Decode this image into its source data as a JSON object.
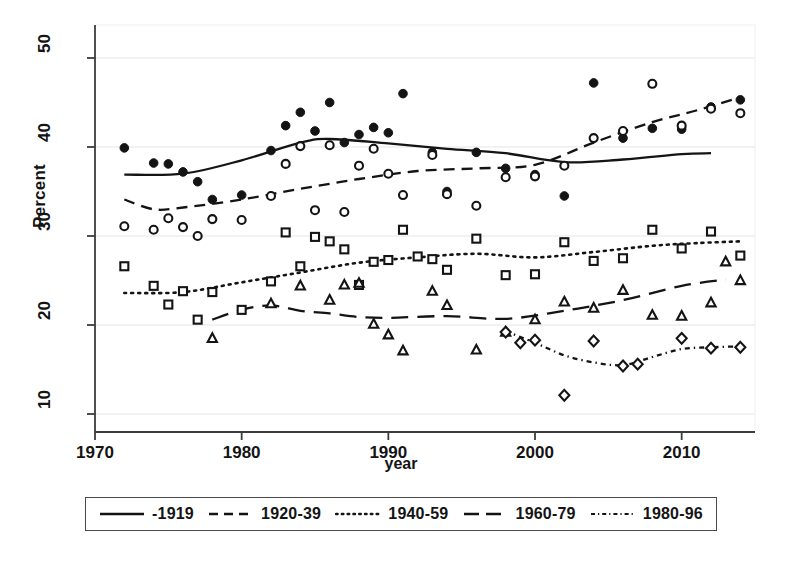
{
  "chart_data": {
    "type": "scatter",
    "title": "",
    "xlabel": "year",
    "ylabel": "Percent",
    "xlim": [
      1970,
      2015
    ],
    "ylim": [
      8,
      52
    ],
    "xticks": [
      1970,
      1980,
      1990,
      2000,
      2010
    ],
    "yticks": [
      10,
      20,
      30,
      40,
      50
    ],
    "grid": "horizontal-faint",
    "legend_position": "below-plot",
    "series": [
      {
        "name": "-1919",
        "marker": "filled-circle",
        "line": "solid",
        "points": [
          {
            "x": 1972,
            "y": 39.9
          },
          {
            "x": 1974,
            "y": 38.2
          },
          {
            "x": 1975,
            "y": 38.1
          },
          {
            "x": 1976,
            "y": 37.2
          },
          {
            "x": 1977,
            "y": 36.1
          },
          {
            "x": 1978,
            "y": 34.1
          },
          {
            "x": 1980,
            "y": 34.6
          },
          {
            "x": 1982,
            "y": 39.6
          },
          {
            "x": 1983,
            "y": 42.4
          },
          {
            "x": 1984,
            "y": 43.9
          },
          {
            "x": 1985,
            "y": 41.8
          },
          {
            "x": 1986,
            "y": 45.0
          },
          {
            "x": 1987,
            "y": 40.5
          },
          {
            "x": 1988,
            "y": 41.4
          },
          {
            "x": 1989,
            "y": 42.2
          },
          {
            "x": 1990,
            "y": 41.6
          },
          {
            "x": 1991,
            "y": 46.0
          },
          {
            "x": 1993,
            "y": 39.4
          },
          {
            "x": 1994,
            "y": 35.0
          },
          {
            "x": 1996,
            "y": 39.4
          },
          {
            "x": 1998,
            "y": 37.6
          },
          {
            "x": 2000,
            "y": 36.9
          },
          {
            "x": 2002,
            "y": 34.5
          },
          {
            "x": 2004,
            "y": 47.2
          },
          {
            "x": 2006,
            "y": 41.0
          },
          {
            "x": 2008,
            "y": 42.1
          },
          {
            "x": 2010,
            "y": 42.0
          },
          {
            "x": 2012,
            "y": 44.5
          },
          {
            "x": 2014,
            "y": 45.3
          }
        ],
        "smooth": [
          {
            "x": 1972,
            "y": 36.9
          },
          {
            "x": 1976,
            "y": 37.0
          },
          {
            "x": 1980,
            "y": 38.5
          },
          {
            "x": 1984,
            "y": 40.5
          },
          {
            "x": 1986,
            "y": 40.9
          },
          {
            "x": 1990,
            "y": 40.4
          },
          {
            "x": 1994,
            "y": 39.8
          },
          {
            "x": 1998,
            "y": 39.3
          },
          {
            "x": 2002,
            "y": 38.3
          },
          {
            "x": 2006,
            "y": 38.6
          },
          {
            "x": 2010,
            "y": 39.2
          },
          {
            "x": 2012,
            "y": 39.3
          }
        ]
      },
      {
        "name": "1920-39",
        "marker": "open-circle",
        "line": "dashed",
        "points": [
          {
            "x": 1972,
            "y": 31.1
          },
          {
            "x": 1974,
            "y": 30.7
          },
          {
            "x": 1975,
            "y": 32.0
          },
          {
            "x": 1976,
            "y": 31.0
          },
          {
            "x": 1977,
            "y": 30.0
          },
          {
            "x": 1978,
            "y": 31.9
          },
          {
            "x": 1980,
            "y": 31.8
          },
          {
            "x": 1982,
            "y": 34.5
          },
          {
            "x": 1983,
            "y": 38.1
          },
          {
            "x": 1984,
            "y": 40.1
          },
          {
            "x": 1985,
            "y": 32.9
          },
          {
            "x": 1986,
            "y": 40.2
          },
          {
            "x": 1987,
            "y": 32.7
          },
          {
            "x": 1988,
            "y": 37.9
          },
          {
            "x": 1989,
            "y": 39.8
          },
          {
            "x": 1990,
            "y": 37.0
          },
          {
            "x": 1991,
            "y": 34.6
          },
          {
            "x": 1993,
            "y": 39.1
          },
          {
            "x": 1994,
            "y": 34.7
          },
          {
            "x": 1996,
            "y": 33.4
          },
          {
            "x": 1998,
            "y": 36.6
          },
          {
            "x": 2000,
            "y": 36.7
          },
          {
            "x": 2002,
            "y": 37.9
          },
          {
            "x": 2004,
            "y": 41.0
          },
          {
            "x": 2006,
            "y": 41.8
          },
          {
            "x": 2008,
            "y": 47.1
          },
          {
            "x": 2010,
            "y": 42.4
          },
          {
            "x": 2012,
            "y": 44.3
          },
          {
            "x": 2014,
            "y": 43.8
          }
        ],
        "smooth": [
          {
            "x": 1972,
            "y": 34.1
          },
          {
            "x": 1974,
            "y": 33.0
          },
          {
            "x": 1976,
            "y": 33.2
          },
          {
            "x": 1980,
            "y": 34.1
          },
          {
            "x": 1984,
            "y": 35.3
          },
          {
            "x": 1988,
            "y": 36.4
          },
          {
            "x": 1992,
            "y": 37.3
          },
          {
            "x": 1996,
            "y": 37.6
          },
          {
            "x": 2000,
            "y": 38.0
          },
          {
            "x": 2004,
            "y": 40.5
          },
          {
            "x": 2008,
            "y": 42.8
          },
          {
            "x": 2011,
            "y": 44.1
          },
          {
            "x": 2014,
            "y": 45.6
          }
        ]
      },
      {
        "name": "1940-59",
        "marker": "open-square",
        "line": "dotted",
        "points": [
          {
            "x": 1972,
            "y": 26.6
          },
          {
            "x": 1974,
            "y": 24.4
          },
          {
            "x": 1975,
            "y": 22.3
          },
          {
            "x": 1976,
            "y": 23.8
          },
          {
            "x": 1977,
            "y": 20.6
          },
          {
            "x": 1978,
            "y": 23.7
          },
          {
            "x": 1980,
            "y": 21.7
          },
          {
            "x": 1982,
            "y": 24.9
          },
          {
            "x": 1983,
            "y": 30.4
          },
          {
            "x": 1984,
            "y": 26.6
          },
          {
            "x": 1985,
            "y": 29.9
          },
          {
            "x": 1986,
            "y": 29.4
          },
          {
            "x": 1987,
            "y": 28.5
          },
          {
            "x": 1988,
            "y": 24.5
          },
          {
            "x": 1989,
            "y": 27.1
          },
          {
            "x": 1990,
            "y": 27.3
          },
          {
            "x": 1991,
            "y": 30.7
          },
          {
            "x": 1992,
            "y": 27.7
          },
          {
            "x": 1993,
            "y": 27.4
          },
          {
            "x": 1994,
            "y": 26.2
          },
          {
            "x": 1996,
            "y": 29.7
          },
          {
            "x": 1998,
            "y": 25.6
          },
          {
            "x": 2000,
            "y": 25.7
          },
          {
            "x": 2002,
            "y": 29.3
          },
          {
            "x": 2004,
            "y": 27.2
          },
          {
            "x": 2006,
            "y": 27.5
          },
          {
            "x": 2008,
            "y": 30.7
          },
          {
            "x": 2010,
            "y": 28.6
          },
          {
            "x": 2012,
            "y": 30.5
          },
          {
            "x": 2014,
            "y": 27.8
          }
        ],
        "smooth": [
          {
            "x": 1972,
            "y": 23.6
          },
          {
            "x": 1976,
            "y": 23.7
          },
          {
            "x": 1980,
            "y": 24.8
          },
          {
            "x": 1984,
            "y": 25.9
          },
          {
            "x": 1988,
            "y": 27.0
          },
          {
            "x": 1992,
            "y": 27.6
          },
          {
            "x": 1996,
            "y": 28.0
          },
          {
            "x": 2000,
            "y": 27.6
          },
          {
            "x": 2004,
            "y": 28.2
          },
          {
            "x": 2008,
            "y": 28.9
          },
          {
            "x": 2011,
            "y": 29.2
          },
          {
            "x": 2014,
            "y": 29.4
          }
        ]
      },
      {
        "name": "1960-79",
        "marker": "open-triangle",
        "line": "long-dash",
        "points": [
          {
            "x": 1978,
            "y": 18.5
          },
          {
            "x": 1982,
            "y": 22.4
          },
          {
            "x": 1984,
            "y": 24.4
          },
          {
            "x": 1986,
            "y": 22.8
          },
          {
            "x": 1987,
            "y": 24.5
          },
          {
            "x": 1988,
            "y": 24.7
          },
          {
            "x": 1989,
            "y": 20.1
          },
          {
            "x": 1990,
            "y": 18.9
          },
          {
            "x": 1991,
            "y": 17.1
          },
          {
            "x": 1993,
            "y": 23.8
          },
          {
            "x": 1994,
            "y": 22.2
          },
          {
            "x": 1996,
            "y": 17.2
          },
          {
            "x": 1998,
            "y": 19.2
          },
          {
            "x": 2000,
            "y": 20.6
          },
          {
            "x": 2002,
            "y": 22.6
          },
          {
            "x": 2004,
            "y": 21.9
          },
          {
            "x": 2006,
            "y": 23.9
          },
          {
            "x": 2008,
            "y": 21.1
          },
          {
            "x": 2010,
            "y": 21.0
          },
          {
            "x": 2012,
            "y": 22.5
          },
          {
            "x": 2013,
            "y": 27.1
          },
          {
            "x": 2014,
            "y": 25.0
          }
        ],
        "smooth": [
          {
            "x": 1978,
            "y": 20.6
          },
          {
            "x": 1980,
            "y": 21.7
          },
          {
            "x": 1982,
            "y": 22.2
          },
          {
            "x": 1984,
            "y": 21.6
          },
          {
            "x": 1986,
            "y": 21.3
          },
          {
            "x": 1988,
            "y": 20.9
          },
          {
            "x": 1990,
            "y": 20.8
          },
          {
            "x": 1994,
            "y": 21.0
          },
          {
            "x": 1998,
            "y": 20.7
          },
          {
            "x": 2002,
            "y": 21.6
          },
          {
            "x": 2006,
            "y": 22.8
          },
          {
            "x": 2010,
            "y": 24.4
          },
          {
            "x": 2013,
            "y": 25.1
          }
        ]
      },
      {
        "name": "1980-96",
        "marker": "open-diamond",
        "line": "dash-dot",
        "points": [
          {
            "x": 1998,
            "y": 19.2
          },
          {
            "x": 1999,
            "y": 18.0
          },
          {
            "x": 2000,
            "y": 18.3
          },
          {
            "x": 2002,
            "y": 12.1
          },
          {
            "x": 2004,
            "y": 18.2
          },
          {
            "x": 2006,
            "y": 15.4
          },
          {
            "x": 2007,
            "y": 15.6
          },
          {
            "x": 2010,
            "y": 18.5
          },
          {
            "x": 2012,
            "y": 17.4
          },
          {
            "x": 2014,
            "y": 17.5
          }
        ],
        "smooth": [
          {
            "x": 1998,
            "y": 19.3
          },
          {
            "x": 2000,
            "y": 18.0
          },
          {
            "x": 2002,
            "y": 16.6
          },
          {
            "x": 2004,
            "y": 15.8
          },
          {
            "x": 2006,
            "y": 15.5
          },
          {
            "x": 2008,
            "y": 16.4
          },
          {
            "x": 2010,
            "y": 17.3
          },
          {
            "x": 2012,
            "y": 17.5
          },
          {
            "x": 2014,
            "y": 17.6
          }
        ]
      }
    ]
  },
  "axes": {
    "ylabel": "Percent",
    "xlabel": "year",
    "yticks": [
      "50",
      "40",
      "30",
      "20",
      "10"
    ],
    "xticks": [
      "1970",
      "1980",
      "1990",
      "2000",
      "2010"
    ]
  },
  "legend": {
    "items": [
      {
        "label": "-1919",
        "style": "solid"
      },
      {
        "label": "1920-39",
        "style": "dashed"
      },
      {
        "label": "1940-59",
        "style": "dotted"
      },
      {
        "label": "1960-79",
        "style": "long-dash"
      },
      {
        "label": "1980-96",
        "style": "dash-dot"
      }
    ]
  },
  "colors": {
    "ink": "#141414",
    "axis": "#3c3c3c",
    "grid": "#e6e6e6",
    "background": "#ffffff"
  }
}
